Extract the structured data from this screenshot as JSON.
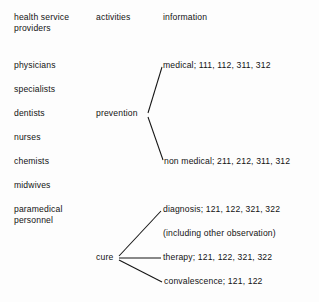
{
  "diagram": {
    "background_color": "#fdfdfd",
    "line_color": "#141414",
    "text_color": "#131313",
    "columns": {
      "providers_header": "health service\nproviders",
      "providers_header_line1": "health service",
      "providers_header_line2": "providers",
      "activities_header": "activities",
      "information_header": "information"
    },
    "providers": [
      {
        "label": "physicians"
      },
      {
        "label": "specialists"
      },
      {
        "label": "dentists"
      },
      {
        "label": "nurses"
      },
      {
        "label": "chemists"
      },
      {
        "label": "midwives"
      },
      {
        "label": "paramedical"
      },
      {
        "label": "personnel"
      }
    ],
    "activities": [
      {
        "label": "prevention"
      },
      {
        "label": "cure"
      }
    ],
    "information": [
      {
        "label": "medical; 111, 112, 311, 312"
      },
      {
        "label": "non medical; 211, 212, 311, 312"
      },
      {
        "label": "diagnosis; 121, 122, 321, 322"
      },
      {
        "label": "(including other observation)"
      },
      {
        "label": "therapy; 121, 122, 321, 322"
      },
      {
        "label": "convalescence; 121, 122"
      }
    ]
  }
}
